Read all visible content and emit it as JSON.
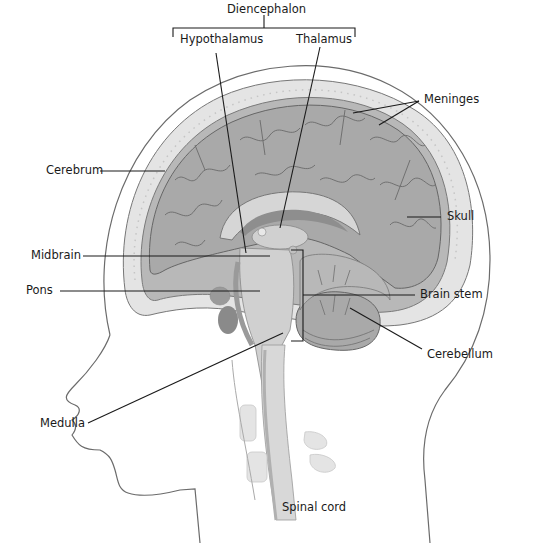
{
  "diagram": {
    "type": "anatomical-sagittal-section",
    "group_label": "Diencephalon",
    "labels": {
      "diencephalon": "Diencephalon",
      "hypothalamus": "Hypothalamus",
      "thalamus": "Thalamus",
      "meninges": "Meninges",
      "cerebrum": "Cerebrum",
      "skull": "Skull",
      "midbrain": "Midbrain",
      "pons": "Pons",
      "brain_stem": "Brain stem",
      "cerebellum": "Cerebellum",
      "medulla": "Medulla",
      "spinal_cord": "Spinal cord"
    },
    "colors": {
      "background": "#ffffff",
      "skin_outline": "#6b6b6b",
      "skull": "#e2e2e2",
      "meninges": "#b5b5b5",
      "brain": "#a9a9a9",
      "brain_light": "#cfcfcf",
      "dark_tissue": "#8e8e8e",
      "leader_line": "#1a1a1a"
    }
  }
}
